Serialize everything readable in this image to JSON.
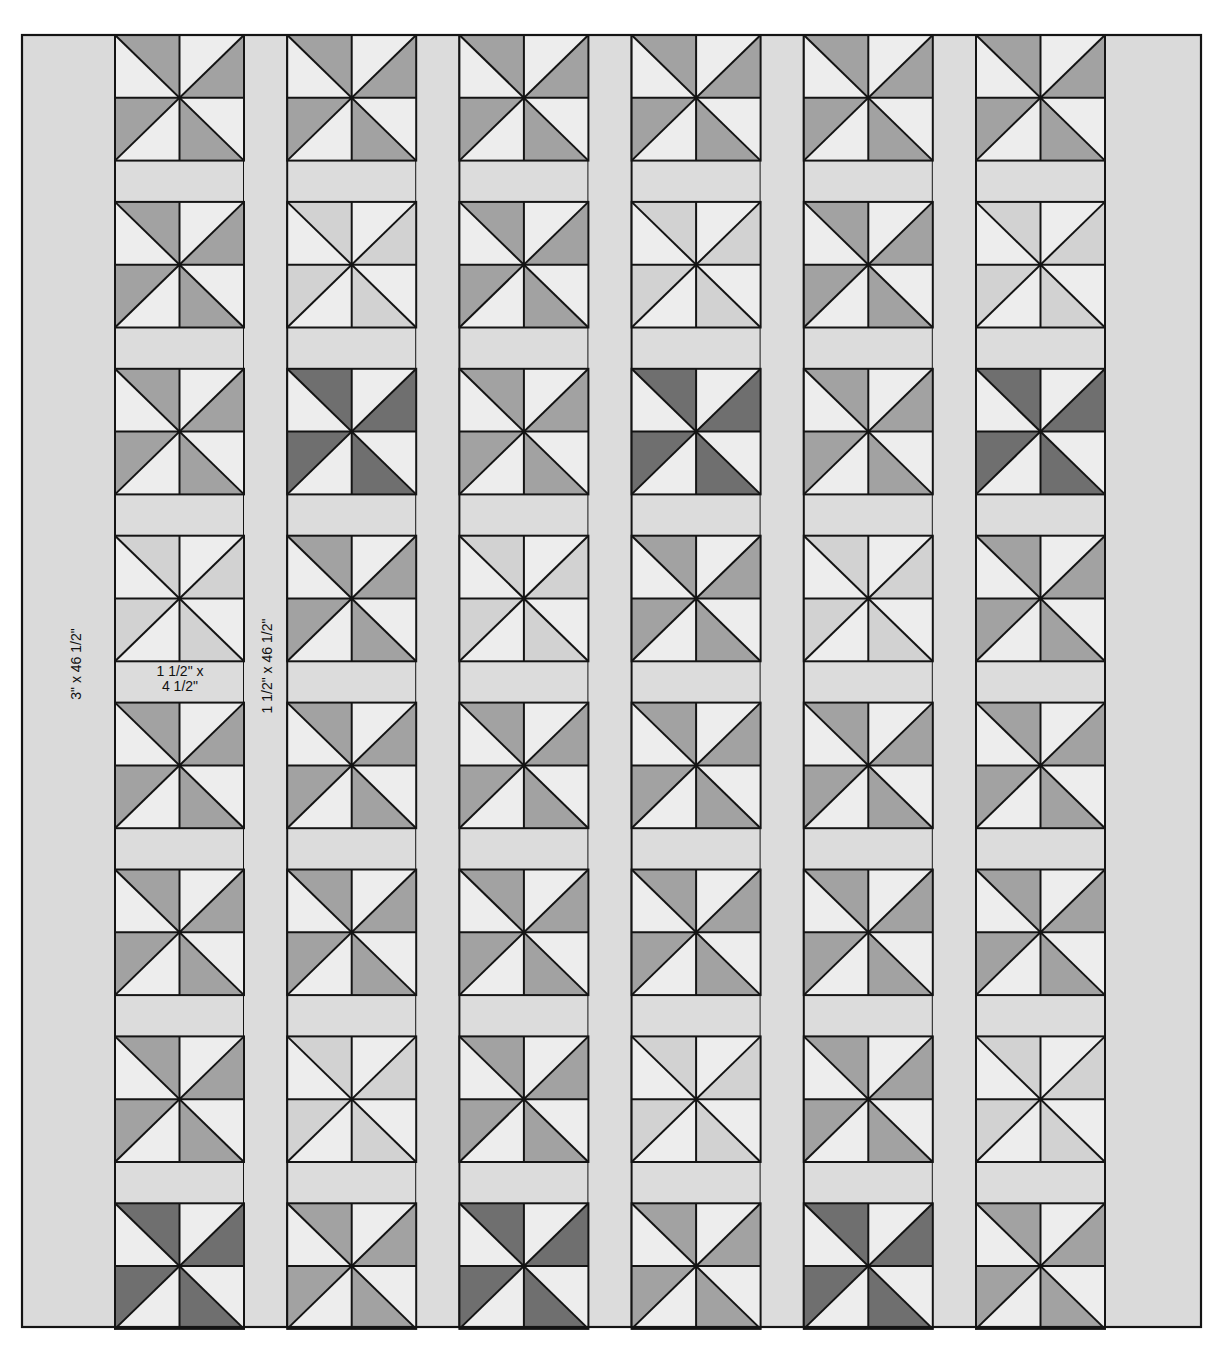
{
  "colors": {
    "outline": "#141414",
    "border_fabric": "#dadada",
    "sashing_fabric": "#dcdcdc",
    "background_fabric": "#ededed",
    "shades": {
      "dark": "#6f6f6f",
      "medium": "#a2a2a2",
      "light": "#d2d2d2"
    }
  },
  "layout": {
    "columns": 6,
    "rows": 8,
    "outer_left": 22,
    "outer_top": 35,
    "outer_right": 1201,
    "outer_bottom": 1327,
    "left_border_width": 93,
    "block_width": 129,
    "block_height": 125.6,
    "vertical_sashing_width": 43.2,
    "horizontal_sashing_height": 41.3
  },
  "blocks": [
    [
      "medium",
      "medium",
      "medium",
      "medium",
      "medium",
      "medium"
    ],
    [
      "medium",
      "light",
      "medium",
      "light",
      "medium",
      "light"
    ],
    [
      "medium",
      "dark",
      "medium",
      "dark",
      "medium",
      "dark"
    ],
    [
      "light",
      "medium",
      "light",
      "medium",
      "light",
      "medium"
    ],
    [
      "medium",
      "medium",
      "medium",
      "medium",
      "medium",
      "medium"
    ],
    [
      "medium",
      "medium",
      "medium",
      "medium",
      "medium",
      "medium"
    ],
    [
      "medium",
      "light",
      "medium",
      "light",
      "medium",
      "light"
    ],
    [
      "dark",
      "medium",
      "dark",
      "medium",
      "dark",
      "medium"
    ]
  ],
  "labels": {
    "border": "3\" x 46 1/2\"",
    "vertical_sashing": "1 1/2\" x 46 1/2\"",
    "horizontal_sashing_line1": "1 1/2\" x",
    "horizontal_sashing_line2": "4 1/2\""
  }
}
